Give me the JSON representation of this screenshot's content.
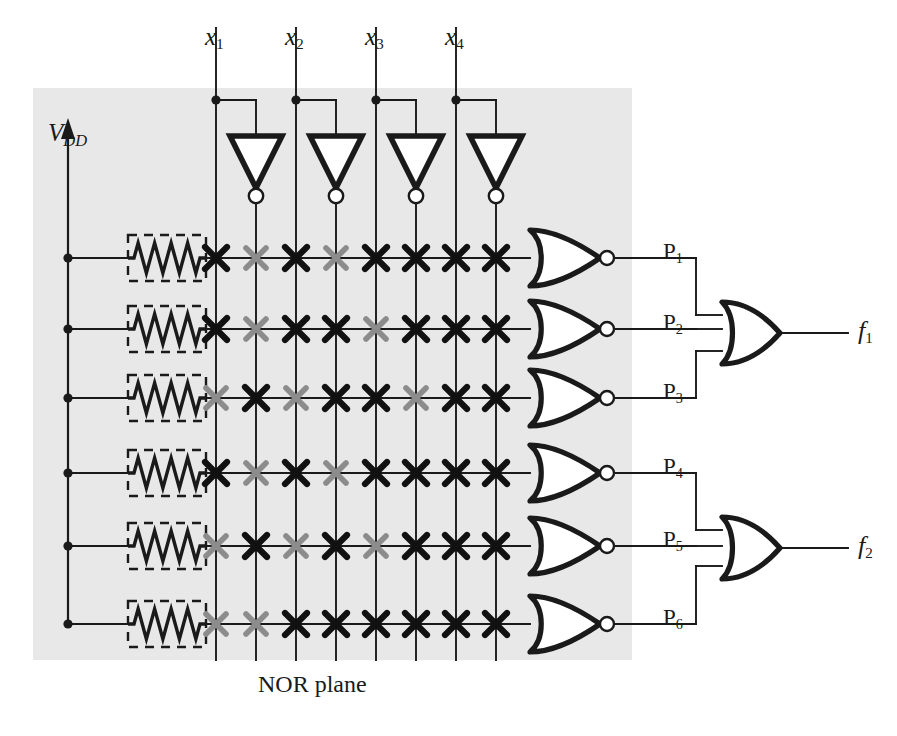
{
  "figure": {
    "plane_label": "NOR plane",
    "supply_label_main": "V",
    "supply_label_sub": "DD",
    "background_color": "#ffffff",
    "shade_color": "#e8e8e8",
    "line_color": "#1a1a1a",
    "active_cross_color": "#111111",
    "inactive_cross_color": "#8c8c8c"
  },
  "inputs": [
    {
      "name": "x1",
      "base": "x",
      "sub": "1",
      "x": 216
    },
    {
      "name": "x2",
      "base": "x",
      "sub": "2",
      "x": 296
    },
    {
      "name": "x3",
      "base": "x",
      "sub": "3",
      "x": 376
    },
    {
      "name": "x4",
      "base": "x",
      "sub": "4",
      "x": 456
    }
  ],
  "columns": [
    {
      "label": "x1",
      "polarity": "true",
      "x": 216
    },
    {
      "label": "x1'",
      "polarity": "complement",
      "x": 256
    },
    {
      "label": "x2",
      "polarity": "true",
      "x": 296
    },
    {
      "label": "x2'",
      "polarity": "complement",
      "x": 336
    },
    {
      "label": "x3",
      "polarity": "true",
      "x": 376
    },
    {
      "label": "x3'",
      "polarity": "complement",
      "x": 416
    },
    {
      "label": "x4",
      "polarity": "true",
      "x": 456
    },
    {
      "label": "x4'",
      "polarity": "complement",
      "x": 496
    }
  ],
  "inverters": [
    {
      "name": "inverter-x1",
      "x": 256
    },
    {
      "name": "inverter-x2",
      "x": 336
    },
    {
      "name": "inverter-x3",
      "x": 416
    },
    {
      "name": "inverter-x4",
      "x": 496
    }
  ],
  "rows": [
    {
      "product": "P1",
      "base": "P",
      "sub": "1",
      "y": 258,
      "crosspoints": [
        1,
        0,
        1,
        0,
        1,
        1,
        1,
        1
      ]
    },
    {
      "product": "P2",
      "base": "P",
      "sub": "2",
      "y": 329,
      "crosspoints": [
        1,
        0,
        1,
        1,
        0,
        1,
        1,
        1
      ]
    },
    {
      "product": "P3",
      "base": "P",
      "sub": "3",
      "y": 398,
      "crosspoints": [
        0,
        1,
        0,
        1,
        1,
        0,
        1,
        1
      ]
    },
    {
      "product": "P4",
      "base": "P",
      "sub": "4",
      "y": 473,
      "crosspoints": [
        1,
        0,
        1,
        0,
        1,
        1,
        1,
        1
      ]
    },
    {
      "product": "P5",
      "base": "P",
      "sub": "5",
      "y": 546,
      "crosspoints": [
        0,
        1,
        0,
        1,
        0,
        1,
        1,
        1
      ]
    },
    {
      "product": "P6",
      "base": "P",
      "sub": "6",
      "y": 624,
      "crosspoints": [
        0,
        0,
        1,
        1,
        1,
        1,
        1,
        1
      ]
    }
  ],
  "outputs": [
    {
      "name": "f1",
      "base": "f",
      "sub": "1",
      "y": 333,
      "inputs": [
        "P1",
        "P2",
        "P3"
      ]
    },
    {
      "name": "f2",
      "base": "f",
      "sub": "2",
      "y": 548,
      "inputs": [
        "P4",
        "P5",
        "P6"
      ]
    }
  ],
  "geometry": {
    "shade": {
      "x": 33,
      "y": 88,
      "w": 599,
      "h": 572
    },
    "vdd_rail_x": 68,
    "vdd_arrow_top_y": 140,
    "resistor_box": {
      "x": 128,
      "w": 78,
      "h": 46
    },
    "row_line_end_x": 530,
    "nor_gate": {
      "x": 530,
      "w": 70,
      "h": 56,
      "bubble_r": 7
    },
    "or_gate": {
      "x": 722,
      "w": 58,
      "h": 62,
      "bubble_r": 0
    },
    "output_line_end_x": 848,
    "input_top_y": 28,
    "input_tap_y": 100
  }
}
